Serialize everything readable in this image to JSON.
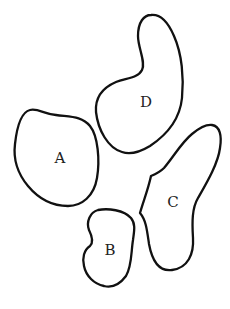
{
  "diagram": {
    "type": "region-map",
    "regions": [
      {
        "id": "A",
        "label": "A"
      },
      {
        "id": "B",
        "label": "B"
      },
      {
        "id": "C",
        "label": "C"
      },
      {
        "id": "D",
        "label": "D"
      }
    ],
    "stroke_color": "#111111",
    "background": "#ffffff"
  }
}
